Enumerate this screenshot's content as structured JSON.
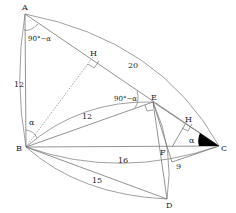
{
  "diagram": {
    "type": "geometry",
    "points": {
      "A": {
        "label": "A",
        "x": 25,
        "y": 14
      },
      "B": {
        "label": "B",
        "x": 26,
        "y": 147
      },
      "C": {
        "label": "C",
        "x": 219,
        "y": 146
      },
      "D": {
        "label": "D",
        "x": 167,
        "y": 199
      },
      "E": {
        "label": "E",
        "x": 153,
        "y": 102
      },
      "F": {
        "label": "F",
        "x": 172,
        "y": 147
      },
      "H1": {
        "label": "H",
        "x": 93,
        "y": 57
      },
      "H2": {
        "label": "H",
        "x": 187,
        "y": 121
      }
    },
    "lengths": {
      "AB": "12",
      "AC": "20",
      "BE": "12",
      "BC": "16",
      "BD": "15",
      "ED": "9"
    },
    "angles": {
      "at_A": "90°−α",
      "at_E": "90°−α",
      "at_B": "α",
      "at_C": "α"
    }
  }
}
